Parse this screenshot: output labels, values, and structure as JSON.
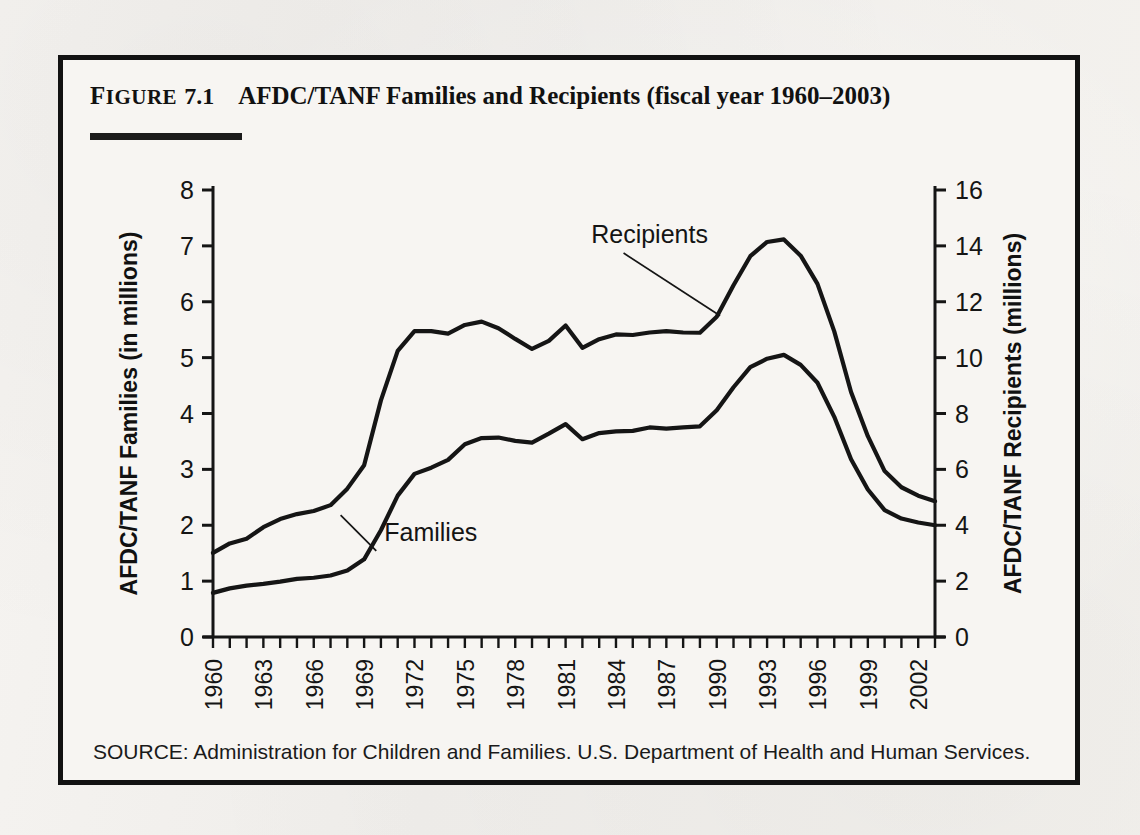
{
  "figure": {
    "label_cap": "F",
    "label_rest": "IGURE",
    "number": "7.1",
    "title": "AFDC/TANF Families and Recipients (fiscal year 1960–2003)",
    "source": "SOURCE: Administration for Children and Families. U.S. Department of Health and Human Services."
  },
  "colors": {
    "ink": "#121212",
    "paper": "#f7f5f2",
    "line": "#151515"
  },
  "chart_data": {
    "type": "line",
    "title": "AFDC/TANF Families and Recipients (fiscal year 1960–2003)",
    "xlabel": "",
    "ylabel": "AFDC/TANF Families (in millions)",
    "y2label": "AFDC/TANF Recipients (millions)",
    "xlim": [
      1960,
      2003
    ],
    "ylim": [
      0,
      8
    ],
    "y2lim": [
      0,
      16
    ],
    "yticks": [
      0,
      1,
      2,
      3,
      4,
      5,
      6,
      7,
      8
    ],
    "y2ticks": [
      0,
      2,
      4,
      6,
      8,
      10,
      12,
      14,
      16
    ],
    "xticks": [
      1960,
      1963,
      1966,
      1969,
      1972,
      1975,
      1978,
      1981,
      1984,
      1987,
      1990,
      1993,
      1996,
      1999,
      2002
    ],
    "xtick_minor_step": 1,
    "grid": false,
    "legend": "annotations",
    "annotations": [
      {
        "text": "Recipients",
        "series": "Recipients",
        "x": 1986.0,
        "y": 7.05,
        "point_x": 1990.2,
        "point_y": 5.75
      },
      {
        "text": "Families",
        "series": "Families",
        "x": 1970.2,
        "y": 1.72,
        "point_x": 1967.6,
        "point_y": 2.18
      }
    ],
    "x": [
      1960,
      1961,
      1962,
      1963,
      1964,
      1965,
      1966,
      1967,
      1968,
      1969,
      1970,
      1971,
      1972,
      1973,
      1974,
      1975,
      1976,
      1977,
      1978,
      1979,
      1980,
      1981,
      1982,
      1983,
      1984,
      1985,
      1986,
      1987,
      1988,
      1989,
      1990,
      1991,
      1992,
      1993,
      1994,
      1995,
      1996,
      1997,
      1998,
      1999,
      2000,
      2001,
      2002,
      2003
    ],
    "series": [
      {
        "name": "Families",
        "axis": "left",
        "unit": "millions",
        "values": [
          0.79,
          0.87,
          0.92,
          0.95,
          0.99,
          1.04,
          1.06,
          1.1,
          1.19,
          1.39,
          1.91,
          2.53,
          2.92,
          3.03,
          3.17,
          3.45,
          3.56,
          3.57,
          3.51,
          3.48,
          3.64,
          3.81,
          3.54,
          3.65,
          3.68,
          3.69,
          3.75,
          3.73,
          3.75,
          3.77,
          4.06,
          4.47,
          4.83,
          4.98,
          5.05,
          4.87,
          4.55,
          3.94,
          3.18,
          2.64,
          2.27,
          2.12,
          2.05,
          2.0
        ]
      },
      {
        "name": "Recipients",
        "axis": "right",
        "unit": "millions",
        "values": [
          3.01,
          3.35,
          3.52,
          3.93,
          4.22,
          4.4,
          4.51,
          4.72,
          5.31,
          6.15,
          8.47,
          10.24,
          10.95,
          10.95,
          10.86,
          11.17,
          11.29,
          11.05,
          10.67,
          10.31,
          10.6,
          11.15,
          10.35,
          10.66,
          10.83,
          10.81,
          10.9,
          10.95,
          10.9,
          10.89,
          11.46,
          12.59,
          13.63,
          14.14,
          14.23,
          13.65,
          12.64,
          10.94,
          8.77,
          7.19,
          5.94,
          5.36,
          5.06,
          4.86
        ]
      }
    ]
  },
  "icons": {
    "chart": "line-chart-icon"
  }
}
